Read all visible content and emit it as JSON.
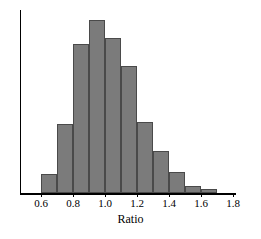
{
  "chart_data": {
    "type": "bar",
    "title": "",
    "subtitle": "",
    "xlabel": "Ratio",
    "ylabel": "",
    "grid": false,
    "legend": null,
    "bin_width": 0.1,
    "xlim": [
      0.5,
      1.8
    ],
    "ylim": [
      0,
      180
    ],
    "xticks": [
      0.6,
      0.8,
      1.0,
      1.2,
      1.4,
      1.6,
      1.8
    ],
    "xtick_labels": [
      "0.6",
      "0.8",
      "1.0",
      "1.2",
      "1.4",
      "1.6",
      "1.8"
    ],
    "yticks": [],
    "ytick_labels": [],
    "categories": [
      "0.6-0.7",
      "0.7-0.8",
      "0.8-0.9",
      "0.9-1.0",
      "1.0-1.1",
      "1.1-1.2",
      "1.2-1.3",
      "1.3-1.4",
      "1.4-1.5",
      "1.5-1.6",
      "1.6-1.7"
    ],
    "bin_starts": [
      0.6,
      0.7,
      0.8,
      0.9,
      1.0,
      1.1,
      1.2,
      1.3,
      1.4,
      1.5,
      1.6
    ],
    "bin_ends": [
      0.7,
      0.8,
      0.9,
      1.0,
      1.1,
      1.2,
      1.3,
      1.4,
      1.5,
      1.6,
      1.7
    ],
    "values": [
      19,
      69,
      149,
      173,
      155,
      127,
      71,
      42,
      21,
      7,
      4
    ],
    "annotations": [],
    "colors": {
      "bar_fill": "#7b7b7b",
      "bar_edge": "#4a4a4a",
      "axis": "#000000",
      "background": "#ffffff",
      "text": "#000000"
    }
  },
  "axis": {
    "x_label": "Ratio"
  }
}
